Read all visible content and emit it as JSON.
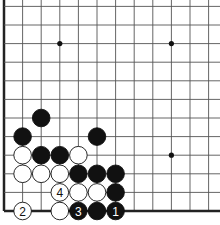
{
  "diagram": {
    "type": "go-board-fragment",
    "grid": {
      "origin_x": 4,
      "origin_y": 211,
      "spacing": 18.6,
      "cols": 12,
      "rows": 12
    },
    "star_points": [
      [
        3,
        9
      ],
      [
        9,
        9
      ],
      [
        9,
        3
      ]
    ],
    "stones": [
      {
        "color": "black",
        "col": 2,
        "row": 5,
        "label": ""
      },
      {
        "color": "black",
        "col": 1,
        "row": 4,
        "label": ""
      },
      {
        "color": "black",
        "col": 5,
        "row": 4,
        "label": ""
      },
      {
        "color": "white",
        "col": 1,
        "row": 3,
        "label": ""
      },
      {
        "color": "black",
        "col": 2,
        "row": 3,
        "label": ""
      },
      {
        "color": "black",
        "col": 3,
        "row": 3,
        "label": ""
      },
      {
        "color": "white",
        "col": 4,
        "row": 3,
        "label": ""
      },
      {
        "color": "white",
        "col": 1,
        "row": 2,
        "label": ""
      },
      {
        "color": "white",
        "col": 2,
        "row": 2,
        "label": ""
      },
      {
        "color": "white",
        "col": 3,
        "row": 2,
        "label": ""
      },
      {
        "color": "black",
        "col": 4,
        "row": 2,
        "label": ""
      },
      {
        "color": "black",
        "col": 5,
        "row": 2,
        "label": ""
      },
      {
        "color": "black",
        "col": 6,
        "row": 2,
        "label": ""
      },
      {
        "color": "white",
        "col": 3,
        "row": 1,
        "label": "4"
      },
      {
        "color": "white",
        "col": 4,
        "row": 1,
        "label": ""
      },
      {
        "color": "white",
        "col": 5,
        "row": 1,
        "label": ""
      },
      {
        "color": "black",
        "col": 6,
        "row": 1,
        "label": ""
      },
      {
        "color": "white",
        "col": 1,
        "row": 0,
        "label": "2"
      },
      {
        "color": "white",
        "col": 3,
        "row": 0,
        "label": ""
      },
      {
        "color": "black",
        "col": 4,
        "row": 0,
        "label": "3"
      },
      {
        "color": "black",
        "col": 5,
        "row": 0,
        "label": ""
      },
      {
        "color": "black",
        "col": 6,
        "row": 0,
        "label": "1"
      }
    ],
    "colors": {
      "line": "#555555",
      "edge": "#222222",
      "black": "#111111",
      "white": "#ffffff",
      "label_on_black": "#ffffff",
      "label_on_white": "#111111"
    }
  }
}
